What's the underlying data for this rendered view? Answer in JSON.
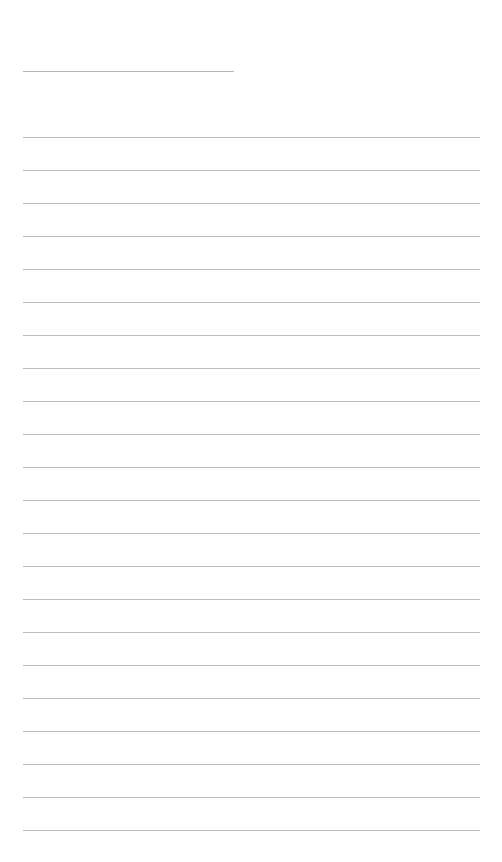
{
  "page": {
    "type": "lined-paper",
    "title_line": {
      "x": 23,
      "y": 71,
      "width": 211
    },
    "rules": {
      "x": 23,
      "width": 457,
      "first_y": 137,
      "spacing": 33,
      "count": 22,
      "color": "#bcbcbc"
    },
    "lines_text": [
      "",
      "",
      "",
      "",
      "",
      "",
      "",
      "",
      "",
      "",
      "",
      "",
      "",
      "",
      "",
      "",
      "",
      "",
      "",
      "",
      "",
      ""
    ],
    "title_text": ""
  }
}
